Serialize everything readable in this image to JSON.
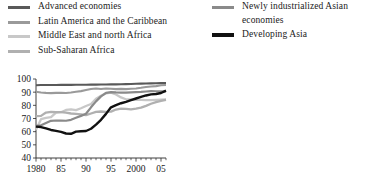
{
  "legend": {
    "left_column": [
      {
        "label": "Advanced economies",
        "color": "#595959",
        "swatch": "line-swatch-icon",
        "weight": "normal"
      },
      {
        "label": "Latin America and the Caribbean",
        "color": "#9a9a9a",
        "swatch": "line-swatch-icon",
        "weight": "normal"
      },
      {
        "label": "Middle East and north Africa",
        "color": "#c8c8c8",
        "swatch": "line-swatch-icon",
        "weight": "normal"
      },
      {
        "label": "Sub-Saharan Africa",
        "color": "#b0b0b0",
        "swatch": "line-swatch-icon",
        "weight": "normal"
      }
    ],
    "right_column": [
      {
        "label": "Newly industrialized Asian\neconomies",
        "color": "#8a8a8a",
        "swatch": "line-swatch-icon",
        "weight": "normal"
      },
      {
        "label": "Developing Asia",
        "color": "#111111",
        "swatch": "line-swatch-icon",
        "weight": "thick"
      }
    ]
  },
  "chart_data": {
    "type": "line",
    "title": "",
    "xlabel": "",
    "ylabel": "",
    "xlim": [
      1980,
      2006
    ],
    "ylim": [
      40,
      100
    ],
    "grid": false,
    "legend_position": "top",
    "y_ticks": [
      40,
      50,
      60,
      70,
      80,
      90,
      100
    ],
    "y_tick_labels": [
      "40",
      "50",
      "60",
      "70",
      "80",
      "90",
      "100"
    ],
    "x_ticks": [
      1980,
      1985,
      1990,
      1995,
      2000,
      2005
    ],
    "x_tick_labels": [
      "1980",
      "85",
      "90",
      "95",
      "2000",
      "05"
    ],
    "x_minor_ticks": [
      1981,
      1982,
      1983,
      1984,
      1986,
      1987,
      1988,
      1989,
      1991,
      1992,
      1993,
      1994,
      1996,
      1997,
      1998,
      1999,
      2001,
      2002,
      2003,
      2004,
      2006
    ],
    "x": [
      1980,
      1981,
      1982,
      1983,
      1984,
      1985,
      1986,
      1987,
      1988,
      1989,
      1990,
      1991,
      1992,
      1993,
      1994,
      1995,
      1996,
      1997,
      1998,
      1999,
      2000,
      2001,
      2002,
      2003,
      2004,
      2005,
      2006
    ],
    "series": [
      {
        "name": "Advanced economies",
        "color": "#595959",
        "width": 2.1,
        "values": [
          95.3,
          95.4,
          95.4,
          95.4,
          95.4,
          95.5,
          95.5,
          95.5,
          95.6,
          95.6,
          95.6,
          95.7,
          95.7,
          95.8,
          95.8,
          95.9,
          95.9,
          96.0,
          96.1,
          96.2,
          96.4,
          96.5,
          96.6,
          96.7,
          96.8,
          96.9,
          96.9
        ]
      },
      {
        "name": "Latin America and the Caribbean",
        "color": "#9a9a9a",
        "width": 2.1,
        "values": [
          90.3,
          89.8,
          89.5,
          89.3,
          89.5,
          89.5,
          89.4,
          89.8,
          90.3,
          90.8,
          91.6,
          92.4,
          92.8,
          92.4,
          92.8,
          92.6,
          92.3,
          92.5,
          92.3,
          92.6,
          92.8,
          93.3,
          93.9,
          94.3,
          94.6,
          95.2,
          95.4
        ]
      },
      {
        "name": "Middle East and north Africa",
        "color": "#c8c8c8",
        "width": 2.3,
        "values": [
          61.5,
          69.5,
          70.5,
          71.0,
          74.5,
          74.8,
          76.5,
          77.0,
          76.4,
          77.8,
          79.5,
          81.0,
          85.0,
          87.3,
          89.1,
          89.6,
          88.2,
          86.0,
          84.6,
          84.5,
          84.2,
          84.1,
          84.0,
          84.0,
          84.2,
          84.4,
          84.6
        ]
      },
      {
        "name": "Sub-Saharan Africa",
        "color": "#b0b0b0",
        "width": 2.3,
        "values": [
          71.8,
          72.0,
          74.5,
          75.0,
          74.9,
          74.8,
          74.4,
          73.8,
          73.5,
          73.2,
          72.5,
          73.8,
          75.0,
          75.3,
          75.1,
          75.2,
          76.8,
          77.5,
          77.3,
          77.0,
          77.5,
          78.2,
          79.6,
          81.2,
          82.5,
          83.4,
          84.2
        ]
      },
      {
        "name": "Newly industrialized Asian economies",
        "color": "#8a8a8a",
        "width": 2.2,
        "values": [
          64.5,
          64.8,
          66.5,
          68.2,
          68.5,
          68.4,
          68.3,
          69.0,
          70.5,
          72.0,
          73.6,
          78.5,
          83.0,
          86.8,
          89.5,
          90.0,
          89.8,
          89.7,
          89.6,
          89.8,
          90.0,
          90.2,
          90.5,
          90.8,
          90.7,
          90.6,
          90.6
        ]
      },
      {
        "name": "Developing Asia",
        "color": "#111111",
        "width": 2.4,
        "values": [
          63.8,
          63.5,
          62.5,
          61.3,
          60.6,
          59.8,
          58.6,
          58.4,
          60.0,
          60.3,
          60.5,
          62.2,
          65.3,
          69.0,
          73.5,
          78.5,
          80.2,
          81.6,
          82.7,
          84.0,
          85.2,
          86.4,
          87.5,
          88.3,
          88.6,
          89.4,
          91.2
        ]
      }
    ]
  }
}
